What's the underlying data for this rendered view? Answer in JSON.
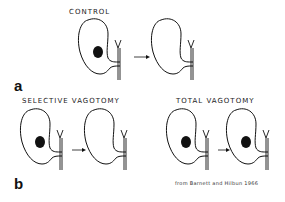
{
  "panels": {
    "a": {
      "letter": "a",
      "title": "CONTROL",
      "before": {
        "ulcer": true
      },
      "after": {
        "ulcer": false
      }
    },
    "b_left": {
      "letter": "b",
      "title": "SELECTIVE VAGOTOMY",
      "before": {
        "ulcer": true
      },
      "after": {
        "ulcer": false
      }
    },
    "b_right": {
      "title": "TOTAL VAGOTOMY",
      "before": {
        "ulcer": true
      },
      "after": {
        "ulcer": true
      }
    }
  },
  "credit": "from Barnett and Hilbun 1966",
  "colors": {
    "stroke": "#111111",
    "background": "#ffffff"
  }
}
